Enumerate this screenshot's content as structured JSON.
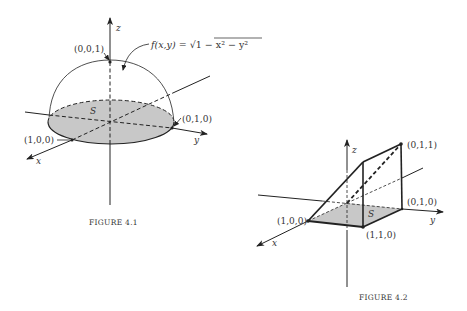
{
  "figure1": {
    "caption": "FIGURE 4.1",
    "region_label": "S",
    "axis_labels": {
      "x": "x",
      "y": "y",
      "z": "z"
    },
    "points": {
      "top": "(0,0,1)",
      "x_point": "(1,0,0)",
      "y_point": "(0,1,0)"
    },
    "formula_lhs": "f(x,y) = ",
    "formula_sqrt": "√",
    "formula_radicand": "1 − x² − y²",
    "colors": {
      "region_fill": "#c8c8c8",
      "line": "#222222"
    }
  },
  "figure2": {
    "caption": "FIGURE 4.2",
    "region_label": "S",
    "axis_labels": {
      "x": "x",
      "y": "y",
      "z": "z"
    },
    "points": {
      "p011": "(0,1,1)",
      "p010": "(0,1,0)",
      "p100": "(1,0,0)",
      "p110": "(1,1,0)"
    },
    "colors": {
      "region_fill": "#c8c8c8",
      "line": "#222222"
    }
  }
}
